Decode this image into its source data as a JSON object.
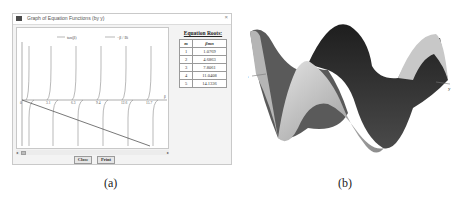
{
  "window": {
    "title": "Graph of Equation Functions (by y)",
    "close_glyph": "×"
  },
  "plot": {
    "legend": [
      {
        "label": "tan(β)"
      },
      {
        "label": "−β / Bi"
      }
    ],
    "x_ticks": [
      "0",
      "3.1",
      "6.3",
      "9.4",
      "12.6",
      "15.7"
    ],
    "x_axis_label": "β",
    "origin_label": "0"
  },
  "roots": {
    "heading": "Equation Roots:",
    "columns": [
      "m",
      "βmn"
    ],
    "rows": [
      {
        "m": "1",
        "value": "1.0769"
      },
      {
        "m": "2",
        "value": "4.6863"
      },
      {
        "m": "3",
        "value": "7.8061"
      },
      {
        "m": "4",
        "value": "11.0408"
      },
      {
        "m": "5",
        "value": "14.1336"
      }
    ]
  },
  "scrollbar": {
    "left_arrow": "◂",
    "right_arrow": "▸"
  },
  "buttons": {
    "close": "Close",
    "print": "Print"
  },
  "captions": {
    "a": "(a)",
    "b": "(b)"
  },
  "surface": {
    "x_label": "x",
    "y_label": "y"
  },
  "colors": {
    "asymptote": "#8a8a8a",
    "line": "#555555",
    "surface_dark": "#2a2a2a",
    "surface_light": "#cfcfcf"
  }
}
